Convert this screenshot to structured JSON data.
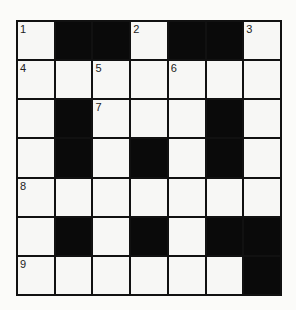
{
  "puzzle": {
    "rows": 7,
    "cols": 7,
    "cells": [
      [
        {
          "n": "1"
        },
        {
          "b": true
        },
        {
          "b": true
        },
        {
          "n": "2"
        },
        {
          "b": true
        },
        {
          "b": true
        },
        {
          "n": "3"
        }
      ],
      [
        {
          "n": "4"
        },
        {},
        {
          "n": "5"
        },
        {},
        {
          "n": "6"
        },
        {},
        {}
      ],
      [
        {},
        {
          "b": true
        },
        {
          "n": "7"
        },
        {},
        {},
        {
          "b": true
        },
        {}
      ],
      [
        {},
        {
          "b": true
        },
        {},
        {
          "b": true
        },
        {},
        {
          "b": true
        },
        {}
      ],
      [
        {
          "n": "8"
        },
        {},
        {},
        {},
        {},
        {},
        {}
      ],
      [
        {},
        {
          "b": true
        },
        {},
        {
          "b": true
        },
        {},
        {
          "b": true
        },
        {
          "b": true
        }
      ],
      [
        {
          "n": "9"
        },
        {},
        {},
        {},
        {},
        {},
        {
          "b": true
        }
      ]
    ],
    "colors": {
      "black_square": "#0a0a0a",
      "white_square": "#f7f7f5",
      "grid_line": "#111111"
    }
  }
}
